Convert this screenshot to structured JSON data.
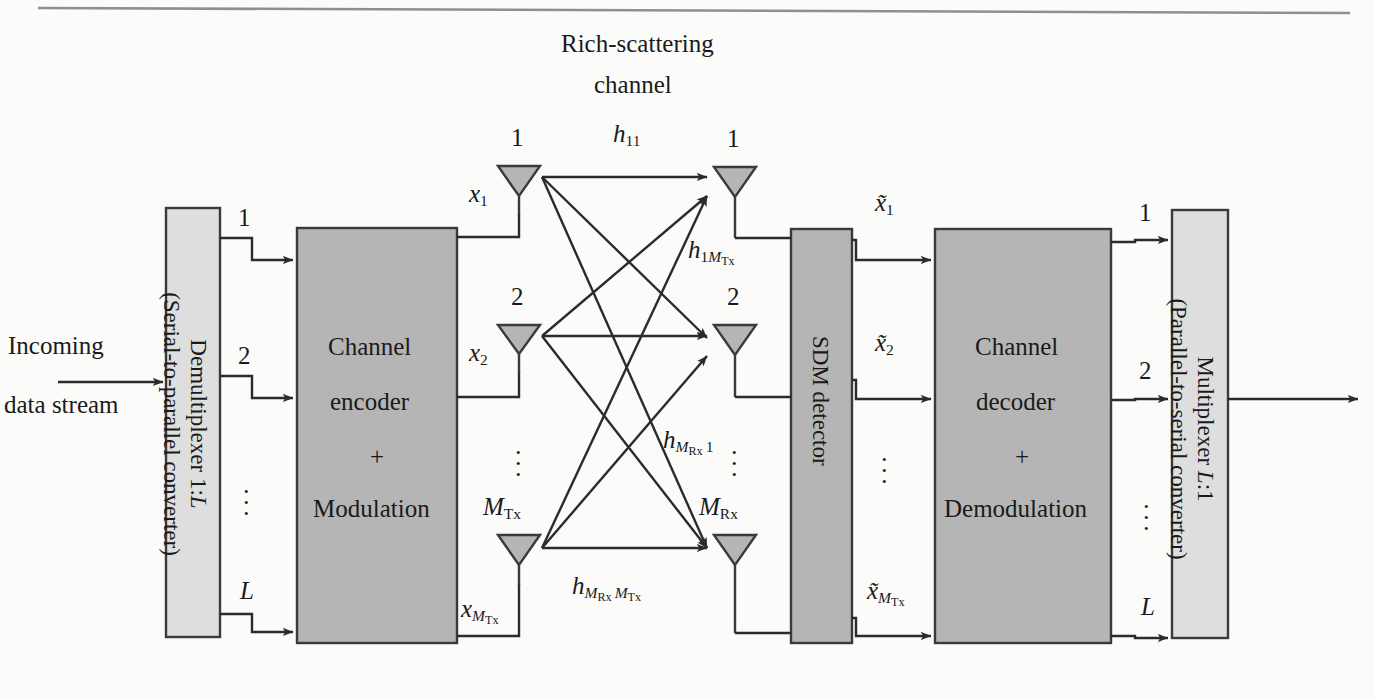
{
  "figure": {
    "title_top": "Rich-scattering",
    "title_top2": "channel",
    "background_color": "#fbfbfa",
    "block_fill_light": "#dedede",
    "block_fill_dark": "#b5b5b5",
    "stroke_color": "#3a3a3a"
  },
  "input": {
    "line1": "Incoming",
    "line2": "data stream"
  },
  "blocks": {
    "demux": {
      "line1": "Demultiplexer 1:",
      "line1_italic": "L",
      "line2": "(Serial-to-parallel converter)"
    },
    "encoder": {
      "line1": "Channel",
      "line2": "encoder",
      "line3": "+",
      "line4": "Modulation"
    },
    "sdm": {
      "label": "SDM   detector"
    },
    "decoder": {
      "line1": "Channel",
      "line2": "decoder",
      "line3": "+",
      "line4": "Demodulation"
    },
    "mux": {
      "line1": "Multiplexer ",
      "line1_italic": "L",
      "line1_tail": ":1",
      "line2": "(Parallel-to-serial converter)"
    }
  },
  "demux_outputs": [
    "1",
    "2",
    "L"
  ],
  "decoder_outputs": [
    "1",
    "2",
    "L"
  ],
  "tx_antennas": [
    {
      "index": "1",
      "sub": "",
      "signal": "x",
      "signal_sub": "1"
    },
    {
      "index": "2",
      "sub": "",
      "signal": "x",
      "signal_sub": "2"
    },
    {
      "index": "M",
      "sub": "Tx",
      "signal": "x",
      "signal_sub": "M_Tx"
    }
  ],
  "rx_antennas": [
    {
      "index": "1",
      "sub": "",
      "signal": "x̃",
      "signal_sub": "1"
    },
    {
      "index": "2",
      "sub": "",
      "signal": "x̃",
      "signal_sub": "2"
    },
    {
      "index": "M",
      "sub": "Rx",
      "signal": "x̃",
      "signal_sub": "M_Tx"
    }
  ],
  "channel_labels": [
    {
      "name": "h11",
      "base": "h",
      "sub": "11"
    },
    {
      "name": "h1MTx",
      "base": "h",
      "sub": "1M_Tx"
    },
    {
      "name": "hMRx1",
      "base": "h",
      "sub": "M_Rx 1"
    },
    {
      "name": "hMRxMTx",
      "base": "h",
      "sub": "M_Rx M_Tx"
    }
  ],
  "ellipsis": "⋮"
}
